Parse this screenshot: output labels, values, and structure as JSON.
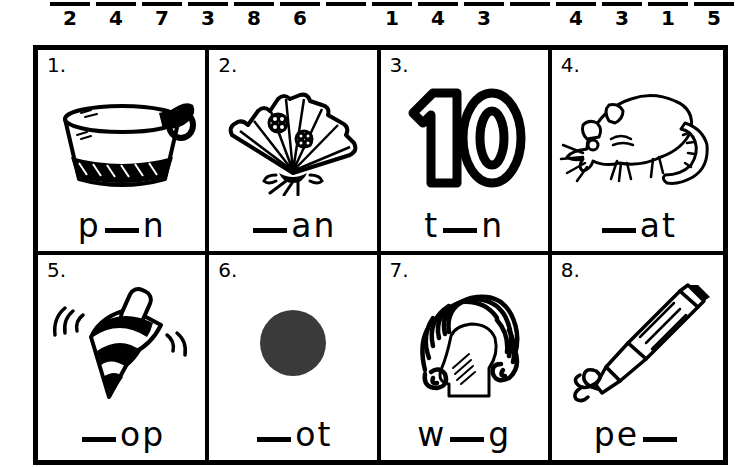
{
  "answer_strip": {
    "name": "answer-number-blanks",
    "slots": [
      {
        "number": "2",
        "has_rule": true
      },
      {
        "number": "4",
        "has_rule": true
      },
      {
        "number": "7",
        "has_rule": true
      },
      {
        "number": "3",
        "has_rule": true
      },
      {
        "number": "8",
        "has_rule": true
      },
      {
        "number": "6",
        "has_rule": true
      },
      {
        "number": "",
        "has_rule": true
      },
      {
        "number": "1",
        "has_rule": true
      },
      {
        "number": "4",
        "has_rule": true
      },
      {
        "number": "3",
        "has_rule": true
      },
      {
        "number": "",
        "has_rule": true
      },
      {
        "number": "4",
        "has_rule": true
      },
      {
        "number": "3",
        "has_rule": true
      },
      {
        "number": "1",
        "has_rule": true
      },
      {
        "number": "5",
        "has_rule": true
      }
    ]
  },
  "grid": {
    "columns": 4,
    "rows": 2,
    "cells": [
      {
        "number": "1.",
        "picture": "saucepan-icon",
        "word_before": "p",
        "word_blank": "__",
        "word_after": "n",
        "answer_word": "pan"
      },
      {
        "number": "2.",
        "picture": "folding-fan-icon",
        "word_before": "",
        "word_blank": "__",
        "word_after": "an",
        "answer_word": "fan"
      },
      {
        "number": "3.",
        "picture": "number-ten-icon",
        "word_before": "t",
        "word_blank": "__",
        "word_after": "n",
        "answer_word": "ten"
      },
      {
        "number": "4.",
        "picture": "rat-icon",
        "word_before": "",
        "word_blank": "__",
        "word_after": "at",
        "answer_word": "rat"
      },
      {
        "number": "5.",
        "picture": "spinning-top-icon",
        "word_before": "",
        "word_blank": "__",
        "word_after": "op",
        "answer_word": "top"
      },
      {
        "number": "6.",
        "picture": "dot-icon",
        "word_before": "",
        "word_blank": "__",
        "word_after": "ot",
        "answer_word": "dot"
      },
      {
        "number": "7.",
        "picture": "wig-icon",
        "word_before": "w",
        "word_blank": "__",
        "word_after": "g",
        "answer_word": "wig"
      },
      {
        "number": "8.",
        "picture": "pen-icon",
        "word_before": "pe",
        "word_blank": "__",
        "word_after": "",
        "answer_word": "pen"
      }
    ]
  },
  "colors": {
    "ink": "#000000",
    "paper": "#ffffff"
  }
}
